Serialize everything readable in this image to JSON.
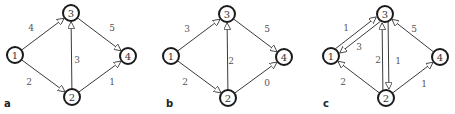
{
  "panels": [
    {
      "label": "a",
      "offset_x": 0,
      "nodes": [
        {
          "id": "1",
          "x": 15,
          "y": 55
        },
        {
          "id": "3",
          "x": 71,
          "y": 13
        },
        {
          "id": "2",
          "x": 72,
          "y": 97
        },
        {
          "id": "4",
          "x": 128,
          "y": 56
        }
      ],
      "edges": [
        {
          "from": "1",
          "to": "3",
          "weight": "4",
          "wx": 31,
          "wy": 28
        },
        {
          "from": "1",
          "to": "2",
          "weight": "2",
          "wx": 29,
          "wy": 82
        },
        {
          "from": "2",
          "to": "3",
          "weight": "3",
          "wx": 77,
          "wy": 60
        },
        {
          "from": "3",
          "to": "4",
          "weight": "5",
          "wx": 112,
          "wy": 28
        },
        {
          "from": "2",
          "to": "4",
          "weight": "1",
          "wx": 112,
          "wy": 82
        }
      ]
    },
    {
      "label": "b",
      "offset_x": 150,
      "nodes": [
        {
          "id": "1",
          "x": 21,
          "y": 56
        },
        {
          "id": "3",
          "x": 77,
          "y": 14
        },
        {
          "id": "2",
          "x": 78,
          "y": 98
        },
        {
          "id": "4",
          "x": 134,
          "y": 57
        }
      ],
      "edges": [
        {
          "from": "1",
          "to": "3",
          "weight": "3",
          "wx": 37,
          "wy": 29
        },
        {
          "from": "1",
          "to": "2",
          "weight": "2",
          "wx": 35,
          "wy": 82
        },
        {
          "from": "2",
          "to": "3",
          "weight": "2",
          "wx": 81,
          "wy": 61
        },
        {
          "from": "3",
          "to": "4",
          "weight": "5",
          "wx": 117,
          "wy": 29
        },
        {
          "from": "2",
          "to": "4",
          "weight": "0",
          "wx": 117,
          "wy": 83
        }
      ]
    },
    {
      "label": "c",
      "offset_x": 300,
      "nodes": [
        {
          "id": "1",
          "x": 31,
          "y": 56
        },
        {
          "id": "3",
          "x": 85,
          "y": 14
        },
        {
          "id": "2",
          "x": 86,
          "y": 98
        },
        {
          "id": "4",
          "x": 140,
          "y": 57
        }
      ],
      "edges": [
        {
          "from": "1",
          "to": "3",
          "weight": "1",
          "wx": 46,
          "wy": 28,
          "shift": -3
        },
        {
          "from": "3",
          "to": "1",
          "weight": "3",
          "wx": 59,
          "wy": 47,
          "shift": -3
        },
        {
          "from": "2",
          "to": "3",
          "weight": "2",
          "wx": 78,
          "wy": 60,
          "shift": -3
        },
        {
          "from": "3",
          "to": "2",
          "weight": "1",
          "wx": 98,
          "wy": 61,
          "shift": -3
        },
        {
          "from": "2",
          "to": "1",
          "weight": "2",
          "wx": 43,
          "wy": 82
        },
        {
          "from": "4",
          "to": "3",
          "weight": "5",
          "wx": 114,
          "wy": 29
        },
        {
          "from": "2",
          "to": "4",
          "weight": "1",
          "wx": 124,
          "wy": 84
        }
      ]
    }
  ],
  "style": {
    "node_stroke": "#1a1a1a",
    "edge_color": "#3a3a3a",
    "text_color": "#555555"
  }
}
